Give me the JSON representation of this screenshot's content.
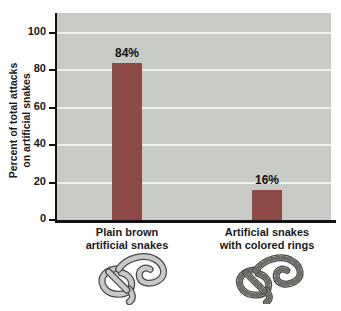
{
  "chart_data": {
    "type": "bar",
    "categories": [
      "Plain brown artificial snakes",
      "Artificial snakes with colored rings"
    ],
    "values": [
      84,
      16
    ],
    "value_labels": [
      "84%",
      "16%"
    ],
    "ylabel": "Percent of total attacks on artificial snakes",
    "ylabel_lines": [
      "Percent of total attacks",
      "on artificial snakes"
    ],
    "yticks": [
      0,
      20,
      40,
      60,
      80,
      100
    ],
    "ylim": [
      0,
      100
    ],
    "xlabel": "",
    "grid": true,
    "legend": false,
    "bar_color": "#8e4a45",
    "plot_bg": "#c7cac5",
    "gridline_color": "#eef0ec",
    "axis_color": "#131313"
  },
  "category_labels": [
    {
      "line1": "Plain brown",
      "line2": "artificial snakes"
    },
    {
      "line1": "Artificial snakes",
      "line2": "with colored rings"
    }
  ],
  "illustrations": [
    {
      "name": "plain-brown-artificial-snake"
    },
    {
      "name": "artificial-snake-with-colored-rings"
    }
  ]
}
